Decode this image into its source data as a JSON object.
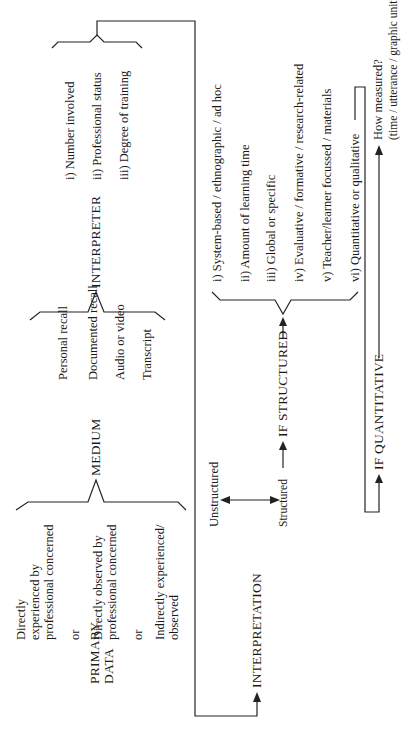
{
  "primary": {
    "label_line1": "PRIMARY",
    "label_line2": "DATA",
    "options": [
      {
        "lines": [
          "Directly",
          "experienced by",
          "professional concerned"
        ]
      },
      {
        "sep": "or"
      },
      {
        "lines": [
          "Directly observed by",
          "professional concerned"
        ]
      },
      {
        "sep": "or"
      },
      {
        "lines": [
          "Indirectly experienced/",
          "observed"
        ]
      }
    ]
  },
  "medium": {
    "label": "MEDIUM",
    "options": [
      "Personal recall",
      "Documented recall",
      "Audio or video",
      "Transcript"
    ]
  },
  "interpreter": {
    "label": "INTERPRETER",
    "options": [
      "i)  Number involved",
      "ii)  Professional status",
      "iii) Degree of training"
    ]
  },
  "interpretation": {
    "label": "INTERPRETATION",
    "unstructured": "Unstructured",
    "structured": "Structured",
    "if_structured": "IF STRUCTURED",
    "structured_options": [
      "i)  System-based / ethnographic / ad hoc",
      "ii)  Amount of learning time",
      "iii) Global or specific",
      "iv) Evaluative / formative / research-related",
      "v)  Teacher/learner focussed / materials",
      "vi) Quantitative or qualitative"
    ],
    "if_quantitative": "IF QUANTITATIVE",
    "how_measured": "How measured?",
    "how_measured_detail": "(time / utterance / graphic unit / other)"
  }
}
